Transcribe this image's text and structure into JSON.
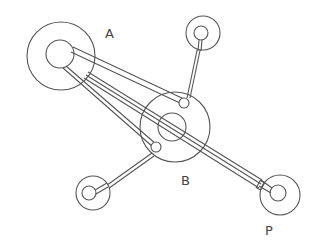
{
  "diagram": {
    "labels": {
      "a": "A",
      "b": "B",
      "p": "P"
    },
    "colors": {
      "stroke": "#555555",
      "background": "#ffffff"
    },
    "nodes": [
      {
        "id": "A",
        "outer": {
          "cx": 61,
          "cy": 56,
          "r": 34
        },
        "inner": {
          "cx": 60,
          "cy": 54,
          "r": 14
        }
      },
      {
        "id": "B",
        "outer": {
          "cx": 175,
          "cy": 127,
          "r": 35
        },
        "inner": {
          "cx": 172,
          "cy": 127,
          "r": 14
        }
      },
      {
        "id": "top",
        "outer": {
          "cx": 203,
          "cy": 33,
          "r": 17
        },
        "inner": {
          "cx": 201,
          "cy": 33,
          "r": 7
        }
      },
      {
        "id": "bottom-left",
        "outer": {
          "cx": 93,
          "cy": 193,
          "r": 17
        },
        "inner": {
          "cx": 89,
          "cy": 193,
          "r": 7
        }
      },
      {
        "id": "P",
        "outer": {
          "cx": 280,
          "cy": 195,
          "r": 20
        },
        "inner": {
          "cx": 278,
          "cy": 193,
          "r": 8
        }
      }
    ]
  }
}
